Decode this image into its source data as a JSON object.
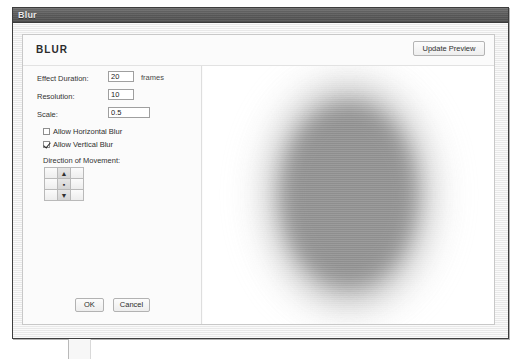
{
  "window": {
    "title": "Blur"
  },
  "dialog": {
    "heading": "BLUR",
    "update_preview_label": "Update Preview",
    "fields": [
      {
        "label": "Effect Duration:",
        "value": "20",
        "units": "frames"
      },
      {
        "label": "Resolution:",
        "value": "10",
        "units": ""
      },
      {
        "label": "Scale:",
        "value": "0.5",
        "units": ""
      }
    ],
    "checkboxes": [
      {
        "label": "Allow Horizontal Blur",
        "checked": false
      },
      {
        "label": "Allow Vertical Blur",
        "checked": true
      }
    ],
    "direction": {
      "label": "Direction of Movement:",
      "cells": [
        {
          "name": "up-left",
          "glyph": ""
        },
        {
          "name": "up",
          "glyph": "▲"
        },
        {
          "name": "up-right",
          "glyph": ""
        },
        {
          "name": "left",
          "glyph": ""
        },
        {
          "name": "center",
          "glyph": "▪"
        },
        {
          "name": "right",
          "glyph": ""
        },
        {
          "name": "down-left",
          "glyph": ""
        },
        {
          "name": "down",
          "glyph": "▼"
        },
        {
          "name": "down-right",
          "glyph": ""
        }
      ]
    },
    "buttons": {
      "ok_label": "OK",
      "cancel_label": "Cancel"
    }
  },
  "preview": {
    "shape": "ellipse",
    "fill_color": "#8d8d8d",
    "background_color": "#ffffff",
    "blur_axis": "vertical"
  }
}
